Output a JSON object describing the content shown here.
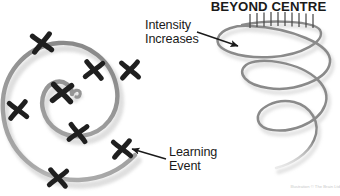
{
  "figure": {
    "title": "BEYOND CENTRE",
    "background_color": "#ffffff",
    "stroke_color": "#8a8a8a",
    "shadow_color": "#cfcfcf",
    "mark_color": "#1f1f1f",
    "annotation_color": "#1a1a1a",
    "width": 340,
    "height": 196
  },
  "annotations": [
    {
      "id": "intensity",
      "text": "Intensity\nIncreases",
      "arrow": {
        "from_x": 197,
        "from_y": 32,
        "to_x": 240,
        "to_y": 46
      },
      "points_to": "coil-top-tick-band"
    },
    {
      "id": "learning",
      "text": "Learning\nEvent",
      "arrow": {
        "from_x": 165,
        "from_y": 159,
        "to_x": 130,
        "to_y": 148
      },
      "points_to": "spiral-outer-x-mark"
    }
  ],
  "left_diagram": {
    "name": "inward-spiral-with-learning-events",
    "marks_count": 7,
    "marks": [
      {
        "x": 42,
        "y": 43,
        "size": 17,
        "rotation": -8
      },
      {
        "x": 94,
        "y": 70,
        "size": 16,
        "rotation": 6
      },
      {
        "x": 130,
        "y": 70,
        "size": 16,
        "rotation": -4
      },
      {
        "x": 62,
        "y": 93,
        "size": 18,
        "rotation": 4
      },
      {
        "x": 18,
        "y": 110,
        "size": 16,
        "rotation": -6
      },
      {
        "x": 78,
        "y": 133,
        "size": 16,
        "rotation": 8
      },
      {
        "x": 122,
        "y": 149,
        "size": 16,
        "rotation": -5
      },
      {
        "x": 58,
        "y": 178,
        "size": 16,
        "rotation": 5
      }
    ]
  },
  "right_diagram": {
    "name": "conical-helix-coil",
    "tick_marks_count": 10,
    "turns": 3
  },
  "credit": "Illustration © The Brain Ltd"
}
